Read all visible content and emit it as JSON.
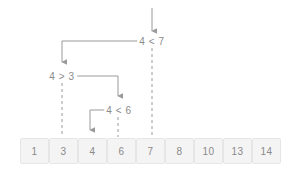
{
  "diagram": {
    "type": "binary-search-trace",
    "title": "",
    "colors": {
      "line": "#9a9a9a",
      "text": "#8a8a8a",
      "cell_fill": "#f4f4f4",
      "cell_border": "#e6e6e6",
      "background": "#ffffff"
    },
    "array": {
      "values": [
        "1",
        "3",
        "4",
        "6",
        "7",
        "8",
        "10",
        "13",
        "14"
      ],
      "cell_width": 29,
      "cell_height": 26,
      "start_x": 20,
      "start_y": 138
    },
    "steps": [
      {
        "id": "step-1",
        "label": "4 < 7",
        "x": 152,
        "y": 41,
        "target_value": "7",
        "target_index": 4,
        "probe_x": 152,
        "result": "less"
      },
      {
        "id": "step-2",
        "label": "4 > 3",
        "x": 62,
        "y": 76,
        "target_value": "3",
        "target_index": 1,
        "probe_x": 62,
        "result": "greater"
      },
      {
        "id": "step-3",
        "label": "4 < 6",
        "x": 119,
        "y": 110,
        "target_value": "6",
        "target_index": 3,
        "probe_x": 118,
        "result": "less"
      }
    ],
    "found": {
      "value": "4",
      "index": 2,
      "x": 90
    }
  }
}
